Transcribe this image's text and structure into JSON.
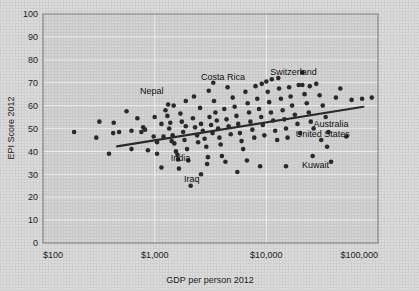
{
  "chart_data": {
    "type": "scatter",
    "title": "",
    "xlabel": "GDP per person 2012",
    "ylabel": "EPI Score 2012",
    "xscale": "log",
    "xlim": [
      100,
      100000
    ],
    "ylim": [
      0,
      100
    ],
    "xticks": [
      100,
      1000,
      10000,
      100000
    ],
    "xticklabels": [
      "$100",
      "$1,000",
      "$10,000",
      "$100,000"
    ],
    "yticks": [
      0,
      10,
      20,
      30,
      40,
      50,
      60,
      70,
      80,
      90,
      100
    ],
    "yticklabels": [
      "0",
      "10",
      "20",
      "30",
      "40",
      "50",
      "60",
      "70",
      "80",
      "90",
      "100"
    ],
    "grid": true,
    "legend": "none",
    "marker_color": "#2b2b2b",
    "plot_bg_color": "#d4d4d4",
    "gridline_color": "#f2f2f2",
    "trendline": {
      "label": "",
      "color": "#2b2b2b",
      "x_start": 460,
      "y_start": 42.2,
      "x_end": 74000,
      "y_end": 59.5
    },
    "annotations": [
      {
        "text": "Nepal",
        "x": 940,
        "y": 66.5
      },
      {
        "text": "Costa Rica",
        "x": 4100,
        "y": 72.5
      },
      {
        "text": "Switzerland",
        "x": 17500,
        "y": 74.5
      },
      {
        "text": "Australia",
        "x": 38000,
        "y": 52.0
      },
      {
        "text": "United States",
        "x": 32000,
        "y": 47.5
      },
      {
        "text": "India",
        "x": 1700,
        "y": 37.0
      },
      {
        "text": "Iraq",
        "x": 2150,
        "y": 28.0
      },
      {
        "text": "Kuwait",
        "x": 27500,
        "y": 34.0
      }
    ],
    "points": [
      {
        "x": 190,
        "y": 48.5
      },
      {
        "x": 320,
        "y": 53.0
      },
      {
        "x": 300,
        "y": 46.0
      },
      {
        "x": 430,
        "y": 52.5
      },
      {
        "x": 425,
        "y": 48.0
      },
      {
        "x": 480,
        "y": 48.5
      },
      {
        "x": 560,
        "y": 57.5
      },
      {
        "x": 620,
        "y": 49.0
      },
      {
        "x": 700,
        "y": 54.5
      },
      {
        "x": 760,
        "y": 48.5
      },
      {
        "x": 790,
        "y": 50.5
      },
      {
        "x": 820,
        "y": 49.5
      },
      {
        "x": 1000,
        "y": 55.0
      },
      {
        "x": 870,
        "y": 40.5
      },
      {
        "x": 390,
        "y": 39.0
      },
      {
        "x": 620,
        "y": 41.0
      },
      {
        "x": 1050,
        "y": 39.0
      },
      {
        "x": 1150,
        "y": 52.0
      },
      {
        "x": 1200,
        "y": 46.5
      },
      {
        "x": 1250,
        "y": 58.0
      },
      {
        "x": 1300,
        "y": 55.5
      },
      {
        "x": 1350,
        "y": 50.0
      },
      {
        "x": 1380,
        "y": 52.5
      },
      {
        "x": 1420,
        "y": 44.5
      },
      {
        "x": 1450,
        "y": 47.0
      },
      {
        "x": 1500,
        "y": 43.5
      },
      {
        "x": 1550,
        "y": 40.0
      },
      {
        "x": 1600,
        "y": 38.5
      },
      {
        "x": 1620,
        "y": 36.5
      },
      {
        "x": 1650,
        "y": 32.5
      },
      {
        "x": 1700,
        "y": 56.5
      },
      {
        "x": 1750,
        "y": 53.0
      },
      {
        "x": 1800,
        "y": 48.5
      },
      {
        "x": 1850,
        "y": 45.0
      },
      {
        "x": 1900,
        "y": 51.0
      },
      {
        "x": 1950,
        "y": 41.0
      },
      {
        "x": 2000,
        "y": 36.0
      },
      {
        "x": 2100,
        "y": 25.0
      },
      {
        "x": 2200,
        "y": 54.5
      },
      {
        "x": 2300,
        "y": 50.5
      },
      {
        "x": 2400,
        "y": 47.0
      },
      {
        "x": 2450,
        "y": 44.0
      },
      {
        "x": 2550,
        "y": 59.0
      },
      {
        "x": 2600,
        "y": 52.0
      },
      {
        "x": 2700,
        "y": 49.0
      },
      {
        "x": 2800,
        "y": 45.5
      },
      {
        "x": 2900,
        "y": 42.0
      },
      {
        "x": 3000,
        "y": 37.5
      },
      {
        "x": 3100,
        "y": 55.0
      },
      {
        "x": 3200,
        "y": 51.5
      },
      {
        "x": 3300,
        "y": 48.0
      },
      {
        "x": 3400,
        "y": 62.0
      },
      {
        "x": 3500,
        "y": 57.0
      },
      {
        "x": 3600,
        "y": 53.5
      },
      {
        "x": 3700,
        "y": 50.0
      },
      {
        "x": 3800,
        "y": 46.0
      },
      {
        "x": 3900,
        "y": 43.0
      },
      {
        "x": 4000,
        "y": 38.0
      },
      {
        "x": 4200,
        "y": 58.5
      },
      {
        "x": 4400,
        "y": 54.0
      },
      {
        "x": 4600,
        "y": 51.0
      },
      {
        "x": 4800,
        "y": 47.5
      },
      {
        "x": 5000,
        "y": 63.5
      },
      {
        "x": 5200,
        "y": 59.5
      },
      {
        "x": 5400,
        "y": 55.5
      },
      {
        "x": 5600,
        "y": 52.0
      },
      {
        "x": 5800,
        "y": 48.0
      },
      {
        "x": 6000,
        "y": 44.5
      },
      {
        "x": 6200,
        "y": 41.0
      },
      {
        "x": 6500,
        "y": 66.0
      },
      {
        "x": 6800,
        "y": 61.0
      },
      {
        "x": 7000,
        "y": 57.0
      },
      {
        "x": 7200,
        "y": 53.0
      },
      {
        "x": 7500,
        "y": 49.5
      },
      {
        "x": 7800,
        "y": 46.0
      },
      {
        "x": 8000,
        "y": 68.5
      },
      {
        "x": 8300,
        "y": 63.0
      },
      {
        "x": 8600,
        "y": 58.5
      },
      {
        "x": 9000,
        "y": 55.0
      },
      {
        "x": 9300,
        "y": 51.5
      },
      {
        "x": 9600,
        "y": 47.0
      },
      {
        "x": 10000,
        "y": 70.5
      },
      {
        "x": 10300,
        "y": 66.0
      },
      {
        "x": 10600,
        "y": 61.5
      },
      {
        "x": 11000,
        "y": 57.0
      },
      {
        "x": 11500,
        "y": 53.5
      },
      {
        "x": 12000,
        "y": 49.0
      },
      {
        "x": 12500,
        "y": 45.0
      },
      {
        "x": 13000,
        "y": 67.5
      },
      {
        "x": 13500,
        "y": 63.0
      },
      {
        "x": 14000,
        "y": 58.0
      },
      {
        "x": 14500,
        "y": 54.0
      },
      {
        "x": 15000,
        "y": 50.0
      },
      {
        "x": 15500,
        "y": 46.0
      },
      {
        "x": 16000,
        "y": 68.0
      },
      {
        "x": 16500,
        "y": 64.0
      },
      {
        "x": 17000,
        "y": 60.0
      },
      {
        "x": 18000,
        "y": 56.0
      },
      {
        "x": 19000,
        "y": 52.0
      },
      {
        "x": 20000,
        "y": 48.0
      },
      {
        "x": 21000,
        "y": 69.0
      },
      {
        "x": 22000,
        "y": 65.0
      },
      {
        "x": 23000,
        "y": 61.0
      },
      {
        "x": 24000,
        "y": 57.0
      },
      {
        "x": 25000,
        "y": 53.0
      },
      {
        "x": 26000,
        "y": 38.0
      },
      {
        "x": 28000,
        "y": 69.5
      },
      {
        "x": 30000,
        "y": 64.5
      },
      {
        "x": 32000,
        "y": 60.0
      },
      {
        "x": 34000,
        "y": 55.0
      },
      {
        "x": 36000,
        "y": 48.5
      },
      {
        "x": 38000,
        "y": 35.5
      },
      {
        "x": 21000,
        "y": 74.5
      },
      {
        "x": 42000,
        "y": 63.5
      },
      {
        "x": 46000,
        "y": 67.5
      },
      {
        "x": 52000,
        "y": 46.5
      },
      {
        "x": 58000,
        "y": 62.5
      },
      {
        "x": 72000,
        "y": 63.0
      },
      {
        "x": 88000,
        "y": 63.5
      },
      {
        "x": 2600,
        "y": 30.0
      },
      {
        "x": 5500,
        "y": 31.0
      },
      {
        "x": 8800,
        "y": 33.5
      },
      {
        "x": 15000,
        "y": 33.5
      },
      {
        "x": 1150,
        "y": 33.0
      },
      {
        "x": 2950,
        "y": 34.5
      },
      {
        "x": 4300,
        "y": 35.5
      },
      {
        "x": 6700,
        "y": 36.0
      },
      {
        "x": 1050,
        "y": 44.0
      },
      {
        "x": 980,
        "y": 46.5
      },
      {
        "x": 1480,
        "y": 60.0
      },
      {
        "x": 2250,
        "y": 64.0
      },
      {
        "x": 3050,
        "y": 66.5
      },
      {
        "x": 4500,
        "y": 68.0
      },
      {
        "x": 11200,
        "y": 71.5
      },
      {
        "x": 12800,
        "y": 72.0
      },
      {
        "x": 9100,
        "y": 69.5
      },
      {
        "x": 19500,
        "y": 69.0
      },
      {
        "x": 24500,
        "y": 68.5
      },
      {
        "x": 3350,
        "y": 70.0
      },
      {
        "x": 1900,
        "y": 62.0
      },
      {
        "x": 1320,
        "y": 60.5
      },
      {
        "x": 26500,
        "y": 50.0
      },
      {
        "x": 31000,
        "y": 45.0
      },
      {
        "x": 35000,
        "y": 42.0
      }
    ]
  }
}
